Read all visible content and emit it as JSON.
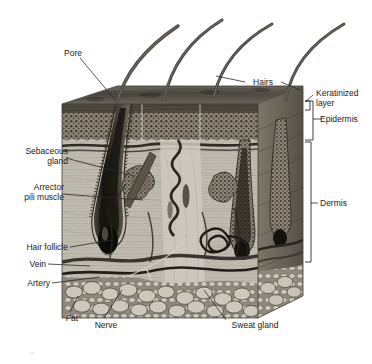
{
  "figure": {
    "type": "anatomical-illustration",
    "style": "grayscale halftone engraving",
    "caption_clipped": "Figure   The structure of the skin"
  },
  "labels": {
    "pore": "Pore",
    "hairs": "Hairs",
    "keratinized_layer": "Keratinized\nlayer",
    "epidermis": "Epidermis",
    "dermis": "Dermis",
    "sebaceous_gland": "Sebaceous\ngland",
    "arrector_pili_muscle": "Arrector\npili muscle",
    "hair_follicle": "Hair follicle",
    "vein": "Vein",
    "artery": "Artery",
    "fat": "Fat",
    "nerve": "Nerve",
    "sweat_gland": "Sweat gland"
  },
  "colors": {
    "background": "#ffffff",
    "text": "#1a1a1a",
    "leader_line": "#2b2b2b",
    "bracket": "#2b2b2b",
    "skin_surface": "#5e5a55",
    "epidermis_tone": "#8a8378",
    "dermis_tone": "#b5b0a6",
    "fat_tone": "#9a958c",
    "hair_tone": "#4a4540",
    "vessel_dark": "#3a3632"
  },
  "structure": {
    "block": {
      "left": 62,
      "top": 96,
      "right": 303,
      "bottom": 330
    },
    "layers": [
      {
        "name": "keratinized-layer",
        "from_y": 98,
        "to_y": 106
      },
      {
        "name": "epidermis",
        "from_y": 98,
        "to_y": 140
      },
      {
        "name": "dermis",
        "from_y": 140,
        "to_y": 252
      },
      {
        "name": "subcutaneous-fat",
        "from_y": 252,
        "to_y": 330
      }
    ],
    "hair_shafts": 4
  }
}
